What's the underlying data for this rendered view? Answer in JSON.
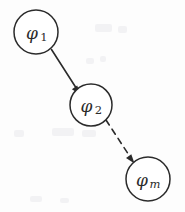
{
  "figure": {
    "background_color": "#fdfdfd",
    "ink_color": "#2b2b2b",
    "width": 185,
    "height": 212
  },
  "nodes": [
    {
      "id": "phi-1",
      "base": "φ",
      "subscript": "1",
      "subscript_style": "roman",
      "cx": 36,
      "cy": 32,
      "r": 22
    },
    {
      "id": "phi-2",
      "base": "φ",
      "subscript": "2",
      "subscript_style": "roman",
      "cx": 91,
      "cy": 105,
      "r": 21
    },
    {
      "id": "phi-m",
      "base": "φ",
      "subscript": "m",
      "subscript_style": "italic",
      "cx": 148,
      "cy": 179,
      "r": 22
    }
  ],
  "edges": [
    {
      "id": "edge-phi1-phi2",
      "from": "phi-1",
      "to": "phi-2",
      "style": "solid",
      "arrow": "filled-triangle"
    },
    {
      "id": "edge-phi2-phim",
      "from": "phi-2",
      "to": "phi-m",
      "style": "dashed",
      "arrow": "filled-triangle"
    }
  ]
}
